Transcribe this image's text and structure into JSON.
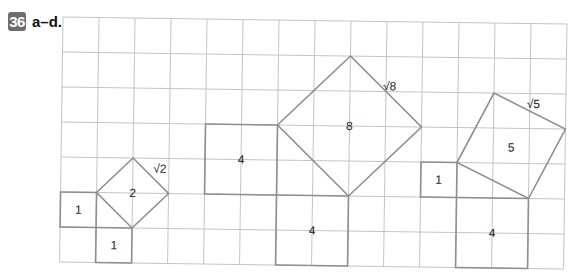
{
  "header": {
    "problem_number": "36",
    "parts_label": "a–d."
  },
  "grid": {
    "columns": 14,
    "rows": 7,
    "cell_width": 36,
    "cell_height": 35,
    "origin": [
      63,
      17
    ],
    "rotation_deg": 0.8,
    "grid_color": "#c4c4c4",
    "shape_color": "#8e8e8e"
  },
  "shapes": [
    {
      "name": "square-area-1-left",
      "kind": "square",
      "points": [
        [
          0,
          5
        ],
        [
          1,
          5
        ],
        [
          1,
          6
        ],
        [
          0,
          6
        ]
      ],
      "label": "1",
      "label_at": [
        0.5,
        5.5
      ]
    },
    {
      "name": "square-area-1-bottom",
      "kind": "square",
      "points": [
        [
          1,
          6
        ],
        [
          2,
          6
        ],
        [
          2,
          7
        ],
        [
          1,
          7
        ]
      ],
      "label": "1",
      "label_at": [
        1.5,
        6.5
      ]
    },
    {
      "name": "tilted-square-area-2",
      "kind": "tilted-square",
      "points": [
        [
          2,
          4
        ],
        [
          3,
          5
        ],
        [
          2,
          6
        ],
        [
          1,
          5
        ]
      ],
      "label": "2",
      "label_at": [
        2,
        5
      ],
      "side_label": "√2",
      "side_label_at": [
        2.75,
        4.3
      ]
    },
    {
      "name": "square-area-4-left",
      "kind": "square",
      "points": [
        [
          4,
          3
        ],
        [
          6,
          3
        ],
        [
          6,
          5
        ],
        [
          4,
          5
        ]
      ],
      "label": "4",
      "label_at": [
        5,
        4
      ]
    },
    {
      "name": "tilted-square-area-8",
      "kind": "tilted-square",
      "points": [
        [
          8,
          1
        ],
        [
          10,
          3
        ],
        [
          8,
          5
        ],
        [
          6,
          3
        ]
      ],
      "label": "8",
      "label_at": [
        8,
        3
      ],
      "side_label": "√8",
      "side_label_at": [
        9.1,
        1.85
      ]
    },
    {
      "name": "square-area-4-middle",
      "kind": "square",
      "points": [
        [
          6,
          5
        ],
        [
          8,
          5
        ],
        [
          8,
          7
        ],
        [
          6,
          7
        ]
      ],
      "label": "4",
      "label_at": [
        7,
        6
      ]
    },
    {
      "name": "square-area-1-right",
      "kind": "square",
      "points": [
        [
          10,
          4
        ],
        [
          11,
          4
        ],
        [
          11,
          5
        ],
        [
          10,
          5
        ]
      ],
      "label": "1",
      "label_at": [
        10.5,
        4.5
      ]
    },
    {
      "name": "tilted-square-area-5",
      "kind": "tilted-square",
      "points": [
        [
          12,
          2
        ],
        [
          14,
          3
        ],
        [
          13,
          5
        ],
        [
          11,
          4
        ]
      ],
      "label": "5",
      "label_at": [
        12.5,
        3.55
      ],
      "side_label": "√5",
      "side_label_at": [
        13.1,
        2.3
      ]
    },
    {
      "name": "square-area-4-right",
      "kind": "square",
      "points": [
        [
          11,
          5
        ],
        [
          13,
          5
        ],
        [
          13,
          7
        ],
        [
          11,
          7
        ]
      ],
      "label": "4",
      "label_at": [
        12,
        6
      ]
    }
  ]
}
